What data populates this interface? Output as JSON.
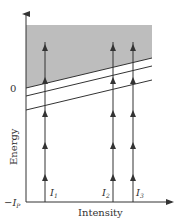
{
  "diagram": {
    "ylabel": "Energy",
    "xlabel": "Intensity",
    "y_ticks": {
      "zero": "0",
      "bottom": {
        "symbol": "−I",
        "subscript": "P"
      }
    },
    "intensity_labels": [
      {
        "symbol": "I",
        "subscript": "1"
      },
      {
        "symbol": "I",
        "subscript": "2"
      },
      {
        "symbol": "I",
        "subscript": "3"
      }
    ],
    "colors": {
      "shade": "#b8b8b8",
      "line": "#333333",
      "text": "#333333"
    }
  }
}
